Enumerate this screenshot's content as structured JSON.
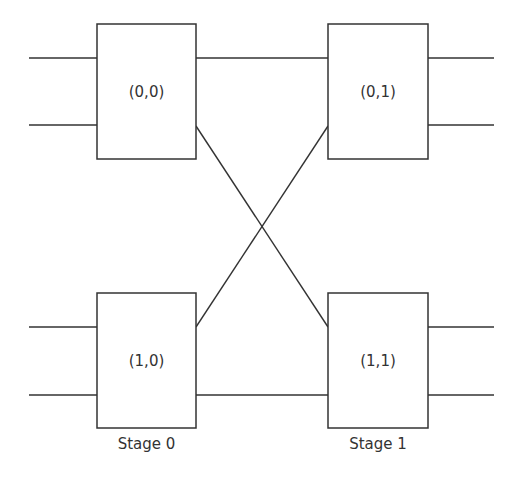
{
  "diagram": {
    "type": "two-stage switching network",
    "colors": {
      "stroke": "#333333",
      "text": "#333333",
      "background": "#ffffff"
    },
    "switches": [
      {
        "id": "s00",
        "label": "(0,0)",
        "stage": 0,
        "row": 0
      },
      {
        "id": "s01",
        "label": "(0,1)",
        "stage": 1,
        "row": 0
      },
      {
        "id": "s10",
        "label": "(1,0)",
        "stage": 0,
        "row": 1
      },
      {
        "id": "s11",
        "label": "(1,1)",
        "stage": 1,
        "row": 1
      }
    ],
    "stages": [
      {
        "label": "Stage 0"
      },
      {
        "label": "Stage 1"
      }
    ],
    "connections": [
      {
        "from": "(0,0)",
        "to": "(0,1)",
        "kind": "straight"
      },
      {
        "from": "(0,0)",
        "to": "(1,1)",
        "kind": "cross"
      },
      {
        "from": "(1,0)",
        "to": "(0,1)",
        "kind": "cross"
      },
      {
        "from": "(1,0)",
        "to": "(1,1)",
        "kind": "straight"
      }
    ],
    "inputs_per_switch": 2,
    "outputs_per_switch": 2
  }
}
